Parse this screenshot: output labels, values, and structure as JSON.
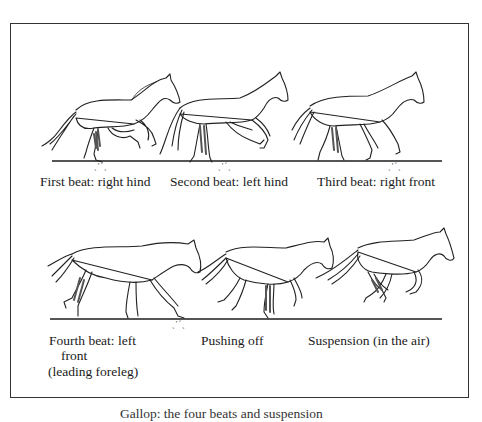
{
  "figure": {
    "row1": {
      "frames": [
        {
          "caption": "First beat: right hind"
        },
        {
          "caption": "Second beat: left hind"
        },
        {
          "caption": "Third beat: right front"
        }
      ]
    },
    "row2": {
      "frames": [
        {
          "caption_line1": "Fourth beat: left",
          "caption_line2": "front",
          "caption_line3": "(leading foreleg)"
        },
        {
          "caption": "Pushing off"
        },
        {
          "caption": "Suspension (in the air)"
        }
      ]
    },
    "hoof_mark": "ˎ′´ˏ",
    "bottom_caption": "Gallop: the four beats and suspension"
  }
}
